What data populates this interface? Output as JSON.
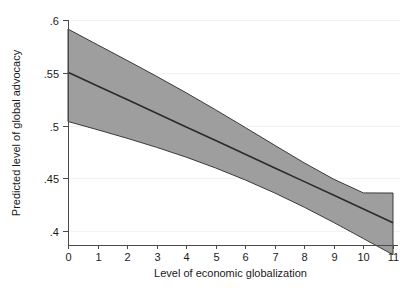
{
  "chart_data": {
    "type": "line",
    "title": "",
    "subtitle": "",
    "xlabel": "Level of economic globalization",
    "ylabel": "Predicted level of global advocacy",
    "xlim": [
      0,
      11
    ],
    "ylim": [
      0.4,
      0.6
    ],
    "xticks": [
      0,
      1,
      2,
      3,
      4,
      5,
      6,
      7,
      8,
      9,
      10,
      11
    ],
    "xticklabels": [
      "0",
      "1",
      "2",
      "3",
      "4",
      "5",
      "6",
      "7",
      "8",
      "9",
      "10",
      "11"
    ],
    "yticks": [
      0.4,
      0.45,
      0.5,
      0.55,
      0.6
    ],
    "yticklabels": [
      ".4",
      ".45",
      ".5",
      ".55",
      ".6"
    ],
    "grid": "horizontal",
    "legend": "none",
    "annotations": [],
    "x": [
      0,
      1,
      2,
      3,
      4,
      5,
      6,
      7,
      8,
      9,
      10,
      11
    ],
    "series": [
      {
        "name": "Predicted level of global advocacy",
        "kind": "fit-line",
        "color": "#2b2b2b",
        "values": [
          0.5505,
          0.5375,
          0.5246,
          0.5116,
          0.4986,
          0.4857,
          0.4727,
          0.4597,
          0.4468,
          0.4338,
          0.4209,
          0.4079
        ]
      },
      {
        "name": "95% confidence interval upper",
        "kind": "ci-upper",
        "color": "#9e9e9e",
        "values": [
          0.5914,
          0.5765,
          0.5617,
          0.5466,
          0.531,
          0.5148,
          0.4981,
          0.4812,
          0.4645,
          0.449,
          0.4361,
          0.436
        ]
      },
      {
        "name": "95% confidence interval lower",
        "kind": "ci-lower",
        "color": "#9e9e9e",
        "values": [
          0.5038,
          0.496,
          0.4879,
          0.4793,
          0.47,
          0.4597,
          0.4484,
          0.436,
          0.4225,
          0.408,
          0.3928,
          0.3775
        ]
      }
    ],
    "band_fill_color": "#9e9e9e",
    "band_edge_color": "#3a3a3a",
    "fit_line_color": "#2b2b2b",
    "background_color": "#ffffff",
    "gridline_color": "#f3f3f3",
    "axis_color": "#4a4a4a"
  }
}
